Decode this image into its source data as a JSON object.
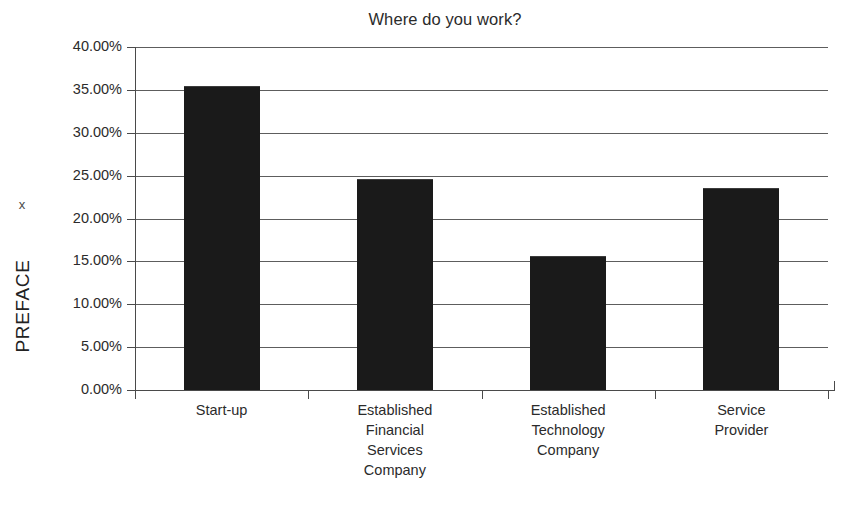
{
  "chart_data": {
    "type": "bar",
    "title": "Where do you work?",
    "xlabel": "",
    "ylabel": "PREFACE",
    "axis_marker": "x",
    "categories": [
      "Start-up",
      "Established Financial Services Company",
      "Established Technology Company",
      "Service Provider"
    ],
    "category_lines": [
      [
        "Start-up"
      ],
      [
        "Established",
        "Financial",
        "Services",
        "Company"
      ],
      [
        "Established",
        "Technology",
        "Company"
      ],
      [
        "Service",
        "Provider"
      ]
    ],
    "values": [
      35.5,
      24.6,
      15.6,
      23.5
    ],
    "value_labels": [
      "35.50%",
      "24.60%",
      "15.60%",
      "23.50%"
    ],
    "ylim": [
      0,
      40
    ],
    "ytick_values": [
      0,
      5,
      10,
      15,
      20,
      25,
      30,
      35,
      40
    ],
    "ytick_labels": [
      "0.00%",
      "5.00%",
      "10.00%",
      "15.00%",
      "20.00%",
      "25.00%",
      "30.00%",
      "35.00%",
      "40.00%"
    ],
    "grid": true,
    "legend": false,
    "bar_color": "#1a1a1a",
    "grid_color": "#5d5d5d",
    "axis_color": "#4a4a4a",
    "background": "#ffffff"
  }
}
